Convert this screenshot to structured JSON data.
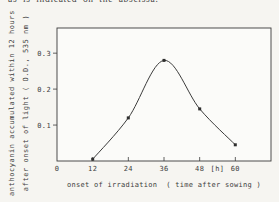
{
  "page": {
    "top_text_fragment": "as is indicated on the abscissa."
  },
  "chart_data": {
    "type": "line",
    "title": "",
    "xlabel": "onset of irradiation  ( time after sowing )",
    "ylabel_line1": "anthocyanin accumulated within 12 hours",
    "ylabel_line2": "after onset of light ( O.D., 535 nm )",
    "x_unit_label": "[h]",
    "x": [
      12,
      24,
      36,
      48,
      60
    ],
    "y": [
      0.005,
      0.12,
      0.28,
      0.145,
      0.045
    ],
    "x_ticks": [
      0,
      12,
      24,
      36,
      48,
      60
    ],
    "y_ticks": [
      0.1,
      0.2,
      0.3
    ],
    "xlim": [
      0,
      72
    ],
    "ylim": [
      0,
      0.37
    ],
    "grid": false,
    "marker": "filled-square",
    "line_color": "#3b3b3b",
    "text_color": "#3d3d3d",
    "plot_background": "#fbfbf9",
    "page_background": "#f6f5f1"
  }
}
